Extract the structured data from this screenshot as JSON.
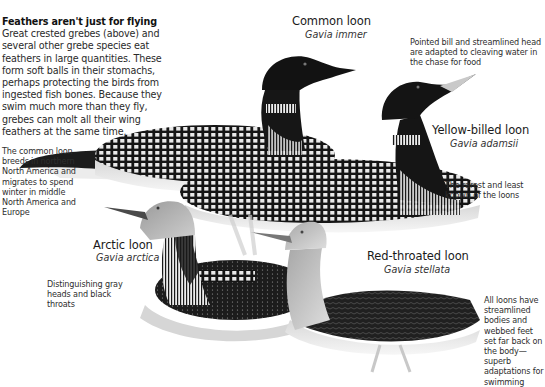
{
  "intro": {
    "heading": "Feathers aren't just for flying",
    "body": "Great crested grebes (above) and several other grebe species eat feathers in large quantities. These form soft balls in their stomachs, perhaps protecting the birds from ingested fish bones. Because they swim much more than they fly, grebes can molt all their wing feathers at the same time."
  },
  "species": [
    {
      "name": "Common loon",
      "latin": "Gavia immer"
    },
    {
      "name": "Yellow-billed loon",
      "latin": "Gavia adamsii"
    },
    {
      "name": "Arctic loon",
      "latin": "Gavia arctica"
    },
    {
      "name": "Red-throated loon",
      "latin": "Gavia stellata"
    }
  ],
  "notes": {
    "bill": "Pointed bill and streamlined head are adapted to cleaving water in the chase for food",
    "common_range": "The common loon breeds in northern North America and migrates to spend winter in middle North America and Europe",
    "rarest": "The rarest and least known of the loons",
    "arctic": "Distinguishing gray heads and black throats",
    "adaptation": "All loons have streamlined bodies and webbed feet set far back on the body—superb adaptations for swimming"
  },
  "illustrations": [
    {
      "subject": "common-loon"
    },
    {
      "subject": "yellow-billed-loon"
    },
    {
      "subject": "arctic-loon"
    },
    {
      "subject": "red-throated-loon"
    }
  ]
}
